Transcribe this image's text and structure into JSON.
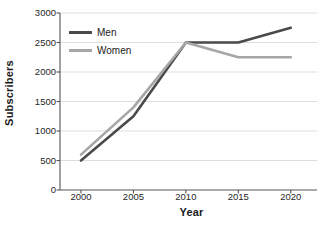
{
  "chart_data": {
    "type": "line",
    "title": "",
    "xlabel": "Year",
    "ylabel": "Subscribers",
    "x": [
      2000,
      2005,
      2010,
      2015,
      2020
    ],
    "xtick_labels": [
      "2000",
      "2005",
      "2010",
      "2015",
      "2020"
    ],
    "ytick_labels": [
      "0",
      "500",
      "1000",
      "1500",
      "2000",
      "2500",
      "3000"
    ],
    "ytick_values": [
      0,
      500,
      1000,
      1500,
      2000,
      2500,
      3000
    ],
    "xlim": [
      1998,
      2022.5
    ],
    "ylim": [
      0,
      3000
    ],
    "grid": "horizontal",
    "legend_position": "upper-left-inside",
    "series": [
      {
        "name": "Men",
        "color": "#4a4a4a",
        "values": [
          500,
          1250,
          2500,
          2500,
          2750
        ]
      },
      {
        "name": "Women",
        "color": "#a6a6a6",
        "values": [
          600,
          1400,
          2500,
          2250,
          2250
        ]
      }
    ]
  },
  "axes": {
    "y_title": "Subscribers",
    "x_title": "Year",
    "spine_color": "#555555",
    "grid_color": "#d4d4d4"
  },
  "legend": {
    "entries": [
      {
        "label": "Men",
        "color": "#4a4a4a"
      },
      {
        "label": "Women",
        "color": "#a6a6a6"
      }
    ]
  }
}
